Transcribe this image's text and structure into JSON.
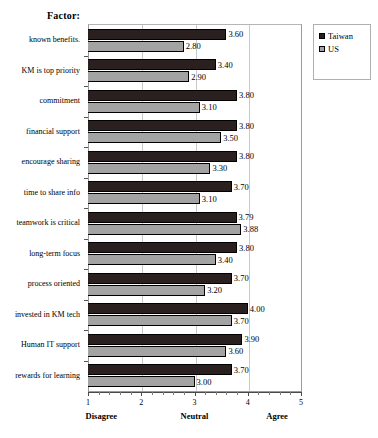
{
  "title": "Factor:",
  "legend": {
    "position": "right",
    "items": [
      {
        "label": "Taiwan",
        "color": "#2b2020"
      },
      {
        "label": "US",
        "color": "#a3a3a3"
      }
    ]
  },
  "axis": {
    "tick_labels": [
      "1",
      "2",
      "3",
      "4",
      "5"
    ],
    "anchors": [
      {
        "label": "Disagree",
        "at": 1.25
      },
      {
        "label": "Neutral",
        "at": 3.0
      },
      {
        "label": "Agree",
        "at": 4.55
      }
    ]
  },
  "chart_data": {
    "type": "bar",
    "orientation": "horizontal",
    "title": "Factor:",
    "xlabel": "",
    "ylabel": "Factor",
    "xlim": [
      1,
      5
    ],
    "xticks": [
      1,
      2,
      3,
      4,
      5
    ],
    "minor_tick_step": 0.2,
    "grid": true,
    "grid_axis": "x",
    "legend_position": "right",
    "scale_anchors": {
      "1": "Disagree",
      "3": "Neutral",
      "5": "Agree"
    },
    "categories": [
      "known benefits.",
      "KM is top priority",
      "commitment",
      "financial support",
      "encourage sharing",
      "time to share info",
      "teamwork is critical",
      "long-term focus",
      "process oriented",
      "invested in KM tech",
      "Human IT support",
      "rewards for learning"
    ],
    "series": [
      {
        "name": "Taiwan",
        "color": "#2b2020",
        "values": [
          3.6,
          3.4,
          3.8,
          3.8,
          3.8,
          3.7,
          3.79,
          3.8,
          3.7,
          4.0,
          3.9,
          3.7
        ],
        "labels": [
          "3.60",
          "3.40",
          "3.80",
          "3.80",
          "3.80",
          "3.70",
          "3.79",
          "3.80",
          "3.70",
          "4.00",
          "3.90",
          "3.70"
        ]
      },
      {
        "name": "US",
        "color": "#a3a3a3",
        "values": [
          2.8,
          2.9,
          3.1,
          3.5,
          3.3,
          3.1,
          3.88,
          3.4,
          3.2,
          3.7,
          3.6,
          3.0
        ],
        "labels": [
          "2.80",
          "2.90",
          "3.10",
          "3.50",
          "3.30",
          "3.10",
          "3.88",
          "3.40",
          "3.20",
          "3.70",
          "3.60",
          "3.00"
        ]
      }
    ]
  }
}
